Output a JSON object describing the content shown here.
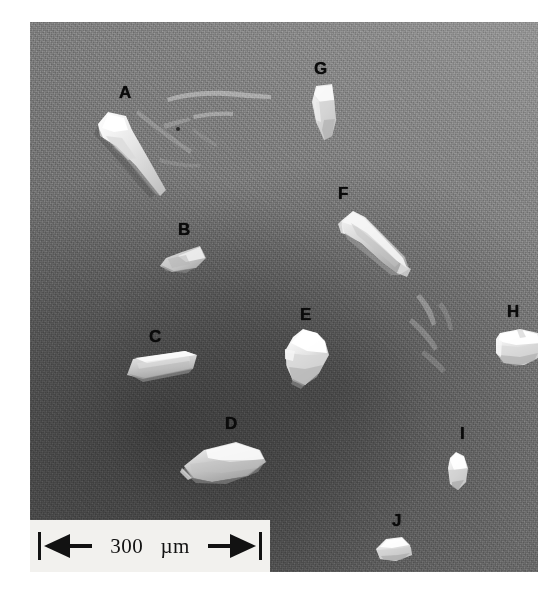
{
  "figure": {
    "type": "scanning-electron-micrograph",
    "background_color": "#7a7a7a",
    "frame": {
      "x": 30,
      "y": 22,
      "width": 508,
      "height": 550
    }
  },
  "scale_bar": {
    "value": "300",
    "unit": "µm",
    "label": "300   µm",
    "box_color": "#f2f1ee",
    "ink_color": "#121212",
    "arrow_style": "double-headed-with-end-caps"
  },
  "particles": [
    {
      "id": "A",
      "label": "A",
      "label_x": 89,
      "label_y": 62,
      "shape": "elongated-tapering-needle",
      "brightness": "very-bright",
      "x": 62,
      "y": 80,
      "width": 86,
      "height": 93
    },
    {
      "id": "B",
      "label": "B",
      "label_x": 148,
      "label_y": 199,
      "shape": "small-triangular-wedge",
      "brightness": "dim",
      "x": 126,
      "y": 222,
      "width": 52,
      "height": 32
    },
    {
      "id": "C",
      "label": "C",
      "label_x": 119,
      "label_y": 306,
      "shape": "elongated-flat-plate",
      "brightness": "medium",
      "x": 93,
      "y": 327,
      "width": 76,
      "height": 33
    },
    {
      "id": "D",
      "label": "D",
      "label_x": 195,
      "label_y": 393,
      "shape": "large-angular-plate",
      "brightness": "medium-bright",
      "x": 148,
      "y": 418,
      "width": 88,
      "height": 45
    },
    {
      "id": "E",
      "label": "E",
      "label_x": 270,
      "label_y": 284,
      "shape": "blocky-chunk",
      "brightness": "very-bright",
      "x": 249,
      "y": 305,
      "width": 53,
      "height": 61
    },
    {
      "id": "F",
      "label": "F",
      "label_x": 308,
      "label_y": 163,
      "shape": "elongated-diagonal-rod",
      "brightness": "bright",
      "x": 305,
      "y": 185,
      "width": 76,
      "height": 67
    },
    {
      "id": "G",
      "label": "G",
      "label_x": 284,
      "label_y": 38,
      "shape": "tapering-wedge",
      "brightness": "bright",
      "x": 276,
      "y": 60,
      "width": 34,
      "height": 60
    },
    {
      "id": "H",
      "label": "H",
      "label_x": 477,
      "label_y": 281,
      "shape": "blocky-faceted-chunk",
      "brightness": "very-bright",
      "x": 460,
      "y": 305,
      "width": 56,
      "height": 42
    },
    {
      "id": "I",
      "label": "I",
      "label_x": 430,
      "label_y": 403,
      "shape": "small-teardrop",
      "brightness": "bright",
      "x": 414,
      "y": 428,
      "width": 25,
      "height": 42
    },
    {
      "id": "J",
      "label": "J",
      "label_x": 362,
      "label_y": 490,
      "shape": "small-trapezoid",
      "brightness": "bright",
      "x": 342,
      "y": 513,
      "width": 42,
      "height": 27
    }
  ],
  "debris": [
    {
      "id": "debris-upper-streak",
      "x": 163,
      "y": 74,
      "width": 76,
      "height": 10
    },
    {
      "id": "debris-second-streak",
      "x": 190,
      "y": 93,
      "width": 42,
      "height": 7
    },
    {
      "id": "debris-speck-dark",
      "x": 177,
      "y": 119,
      "width": 4,
      "height": 4
    },
    {
      "id": "debris-near-a-scratch",
      "x": 133,
      "y": 110,
      "width": 60,
      "height": 38
    },
    {
      "id": "debris-left-of-h",
      "x": 408,
      "y": 290,
      "width": 44,
      "height": 66
    }
  ]
}
